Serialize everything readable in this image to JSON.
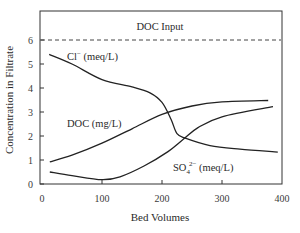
{
  "chart_data": {
    "type": "line",
    "title": "",
    "xlabel": "Bed Volumes",
    "ylabel": "Concentration in Filtrate",
    "xlim": [
      0,
      400
    ],
    "ylim": [
      0,
      6.6
    ],
    "xticks": [
      0,
      100,
      200,
      300,
      400
    ],
    "yticks": [
      0,
      1,
      2,
      3,
      4,
      5,
      6
    ],
    "grid": false,
    "legend": "inline labels",
    "reference_lines": [
      {
        "label": "DOC Input",
        "y": 6,
        "style": "dashed"
      }
    ],
    "series": [
      {
        "name": "Cl⁻ (meq/L)",
        "label_main": "Cl",
        "label_sup": "−",
        "label_rest": " (meq/L)",
        "x": [
          12,
          50,
          100,
          150,
          180,
          200,
          215,
          225,
          240,
          280,
          330,
          393
        ],
        "values": [
          5.4,
          5.0,
          4.35,
          4.05,
          3.8,
          3.4,
          2.7,
          2.1,
          1.9,
          1.6,
          1.45,
          1.33
        ]
      },
      {
        "name": "DOC (mg/L)",
        "label_main": "DOC (mg/L)",
        "x": [
          13,
          50,
          100,
          150,
          200,
          250,
          300,
          377
        ],
        "values": [
          0.92,
          1.2,
          1.7,
          2.3,
          2.9,
          3.25,
          3.42,
          3.48
        ]
      },
      {
        "name": "SO₄²⁻ (meq/L)",
        "label_main": "SO",
        "label_sub": "4",
        "label_sup": "2−",
        "label_rest": " (meq/L)",
        "x": [
          13,
          50,
          100,
          130,
          170,
          210,
          235,
          260,
          300,
          385
        ],
        "values": [
          0.5,
          0.35,
          0.18,
          0.3,
          0.75,
          1.35,
          1.85,
          2.35,
          2.8,
          3.22
        ]
      }
    ]
  }
}
